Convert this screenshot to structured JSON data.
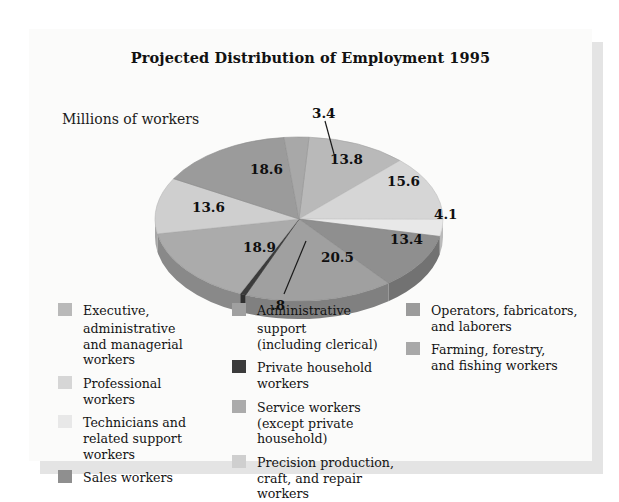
{
  "chart_title": "Projected Distribution of Employment 1995",
  "axis_note": "Millions of workers",
  "chart_data": {
    "type": "pie",
    "title": "Projected Distribution of Employment 1995",
    "unit_label": "Millions of workers",
    "value_total": 122.7,
    "legend_position": "bottom",
    "grid": false,
    "categories": [
      "Executive, administrative and managerial workers",
      "Professional workers",
      "Technicians and related support workers",
      "Sales workers",
      "Administrative support (including clerical)",
      "Private household workers",
      "Service workers (except private household)",
      "Precision production, craft, and repair workers",
      "Operators, fabricators, and laborers",
      "Farming, forestry, and fishing workers"
    ],
    "values": [
      13.8,
      15.6,
      4.1,
      13.4,
      20.5,
      0.8,
      18.9,
      13.6,
      18.6,
      3.4
    ],
    "labels": [
      "13.8",
      "15.6",
      "4.1",
      "13.4",
      "20.5",
      ".8",
      "18.9",
      "13.6",
      "18.6",
      "3.4"
    ],
    "colors": [
      "#b9b9b9",
      "#d6d6d6",
      "#e8e8e8",
      "#8f8f8f",
      "#a0a0a0",
      "#3b3b3b",
      "#ababab",
      "#cfcfcf",
      "#9b9b9b",
      "#a8a8a8"
    ],
    "callouts": [
      "3.4",
      ".8"
    ]
  },
  "pie": {
    "slice_labels": [
      {
        "text": "13.8",
        "x": 196,
        "y": 60
      },
      {
        "text": "15.6",
        "x": 253,
        "y": 82
      },
      {
        "text": "4.1",
        "x": 300,
        "y": 115
      },
      {
        "text": "13.4",
        "x": 256,
        "y": 140
      },
      {
        "text": "20.5",
        "x": 187,
        "y": 158
      },
      {
        "text": "18.9",
        "x": 109,
        "y": 148
      },
      {
        "text": "13.6",
        "x": 58,
        "y": 108
      },
      {
        "text": "18.6",
        "x": 116,
        "y": 70
      }
    ],
    "callout_top": {
      "text": "3.4",
      "x": 178,
      "y": 14
    },
    "callout_bottom": {
      "text": ".8",
      "x": 137,
      "y": 206
    }
  },
  "legend": {
    "columns": [
      {
        "items": [
          {
            "color": "#b9b9b9",
            "line1": "Executive, administrative",
            "line2": "and managerial workers"
          },
          {
            "color": "#d6d6d6",
            "line1": "Professional",
            "line2": "workers"
          },
          {
            "color": "#e8e8e8",
            "line1": "Technicians and",
            "line2": "related support workers"
          },
          {
            "color": "#8f8f8f",
            "line1": "Sales workers",
            "line2": ""
          }
        ]
      },
      {
        "items": [
          {
            "color": "#a0a0a0",
            "line1": "Administrative support",
            "line2": "(including clerical)"
          },
          {
            "color": "#3b3b3b",
            "line1": "Private household",
            "line2": "workers"
          },
          {
            "color": "#ababab",
            "line1": "Service workers",
            "line2": "(except private household)"
          },
          {
            "color": "#cfcfcf",
            "line1": "Precision production,",
            "line2": "craft, and repair workers"
          }
        ]
      },
      {
        "items": [
          {
            "color": "#9b9b9b",
            "line1": "Operators, fabricators,",
            "line2": "and laborers"
          },
          {
            "color": "#a8a8a8",
            "line1": "Farming, forestry,",
            "line2": "and fishing workers"
          }
        ]
      }
    ]
  }
}
